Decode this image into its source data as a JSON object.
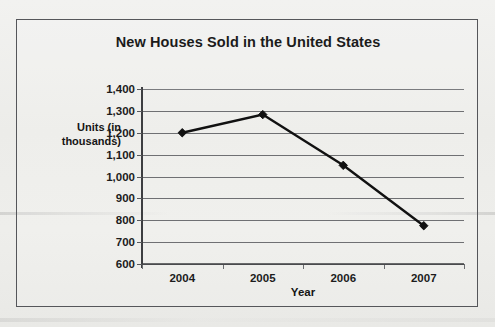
{
  "chart_data": {
    "type": "line",
    "title": "New Houses Sold in the United States",
    "xlabel": "Year",
    "ylabel": "Units (in thousands)",
    "ylabel_lines": [
      "Units (in",
      "thousands)"
    ],
    "categories": [
      "2004",
      "2005",
      "2006",
      "2007"
    ],
    "values": [
      1200,
      1283,
      1051,
      775
    ],
    "series": [
      {
        "name": "New houses sold",
        "values": [
          1200,
          1283,
          1051,
          775
        ]
      }
    ],
    "ylim": [
      600,
      1400
    ],
    "ytick_step": 100,
    "ytick_labels": [
      "1,400",
      "1,300",
      "1,200",
      "1,100",
      "1,000",
      "900",
      "800",
      "700",
      "600"
    ],
    "ytick_values": [
      1400,
      1300,
      1200,
      1100,
      1000,
      900,
      800,
      700,
      600
    ],
    "grid": "horizontal",
    "legend": "none",
    "marker": "diamond",
    "line_color": "#111111",
    "marker_color": "#111111",
    "grid_color": "#6f7073",
    "axis_color": "#3d3e41",
    "text_color": "#1b1b1b",
    "background_color": "#eeeeec",
    "frame_color": "#55565a"
  }
}
